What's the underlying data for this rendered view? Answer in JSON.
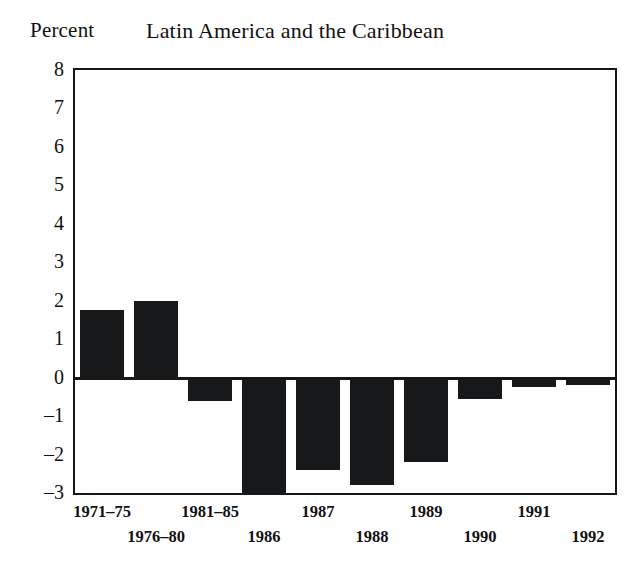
{
  "header": {
    "axis_unit_label": "Percent",
    "title": "Latin America and the Caribbean"
  },
  "chart_data": {
    "type": "bar",
    "title": "Latin America and the Caribbean",
    "xlabel": "",
    "ylabel": "Percent",
    "ylim": [
      -3,
      8
    ],
    "grid": false,
    "legend": null,
    "bar_color": "#17181a",
    "categories": [
      "1971–75",
      "1976–80",
      "1981–85",
      "1986",
      "1987",
      "1988",
      "1989",
      "1990",
      "1991",
      "1992"
    ],
    "values": [
      1.75,
      2.0,
      -0.6,
      -3.05,
      -2.4,
      -2.8,
      -2.2,
      -0.55,
      -0.25,
      -0.2
    ],
    "ytick_labels": [
      "8",
      "7",
      "6",
      "5",
      "4",
      "3",
      "2",
      "1",
      "0",
      "–1",
      "–2",
      "–3"
    ],
    "ytick_values": [
      8,
      7,
      6,
      5,
      4,
      3,
      2,
      1,
      0,
      -1,
      -2,
      -3
    ],
    "xtick_rows": [
      0,
      1,
      0,
      1,
      0,
      1,
      0,
      1,
      0,
      1
    ]
  }
}
